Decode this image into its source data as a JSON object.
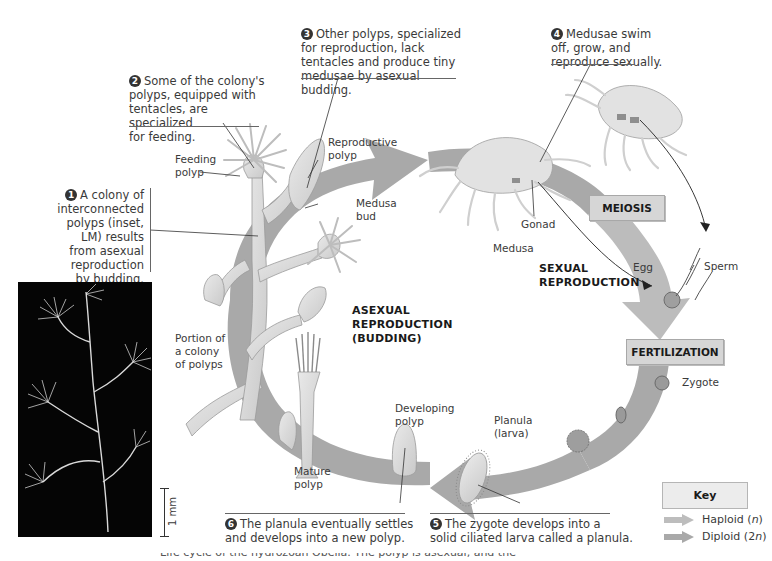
{
  "diagram": {
    "title": "Life cycle of the hydrozoan Obelia",
    "captions": [
      {
        "number": "1",
        "text": "A colony of interconnected polyps (inset, LM) results from asexual reproduction by budding.",
        "lines": [
          "A colony of",
          "interconnected",
          "polyps (inset,",
          "LM) results",
          "from asexual",
          "reproduction",
          "by budding."
        ]
      },
      {
        "number": "2",
        "text": "Some of the colony's polyps, equipped with tentacles, are specialized for feeding.",
        "lines": [
          "Some of the colony's",
          "polyps, equipped with",
          "tentacles, are specialized",
          "for feeding."
        ]
      },
      {
        "number": "3",
        "text": "Other polyps, specialized for reproduction, lack tentacles and produce tiny medusae by asexual budding.",
        "lines": [
          "Other polyps, specialized",
          "for reproduction, lack",
          "tentacles and produce tiny",
          "medusae by asexual budding."
        ]
      },
      {
        "number": "4",
        "text": "Medusae swim off, grow, and reproduce sexually.",
        "lines": [
          "Medusae swim",
          "off, grow, and",
          "reproduce sexually."
        ]
      },
      {
        "number": "5",
        "text": "The zygote develops into a solid ciliated larva called a planula.",
        "lines": [
          "The zygote develops into a",
          "solid ciliated larva called a planula."
        ]
      },
      {
        "number": "6",
        "text": "The planula eventually settles and develops into a new polyp.",
        "lines": [
          "The planula eventually settles",
          "and develops into a new polyp."
        ]
      }
    ],
    "labels": {
      "feeding_polyp": [
        "Feeding",
        "polyp"
      ],
      "reproductive_polyp": [
        "Reproductive",
        "polyp"
      ],
      "medusa_bud": [
        "Medusa",
        "bud"
      ],
      "gonad": "Gonad",
      "medusa": "Medusa",
      "egg": "Egg",
      "sperm": "Sperm",
      "zygote": "Zygote",
      "planula": [
        "Planula",
        "(larva)"
      ],
      "developing_polyp": [
        "Developing",
        "polyp"
      ],
      "mature_polyp": [
        "Mature",
        "polyp"
      ],
      "portion_colony": [
        "Portion of",
        "a colony",
        "of polyps"
      ],
      "scale_bar": "1 mm"
    },
    "phases": {
      "asexual": [
        "ASEXUAL",
        "REPRODUCTION",
        "(BUDDING)"
      ],
      "sexual": [
        "SEXUAL",
        "REPRODUCTION"
      ]
    },
    "stages": {
      "meiosis": "MEIOSIS",
      "fertilization": "FERTILIZATION"
    },
    "key": {
      "title": "Key",
      "items": [
        {
          "label": "Haploid",
          "symbol": "(n)",
          "color": "#b9b9b9"
        },
        {
          "label": "Diploid",
          "symbol": "(2n)",
          "color": "#a9a9a9"
        }
      ]
    },
    "footer_partial": "Life cycle of the hydrozoan Obelia. The polyp is asexual, and the"
  },
  "colors": {
    "cycle_arrow": "#a8a8a8",
    "haploid_arrow": "#bdbdbd",
    "stage_box": "#d6d6d6",
    "organism": "#dcdcdc"
  }
}
